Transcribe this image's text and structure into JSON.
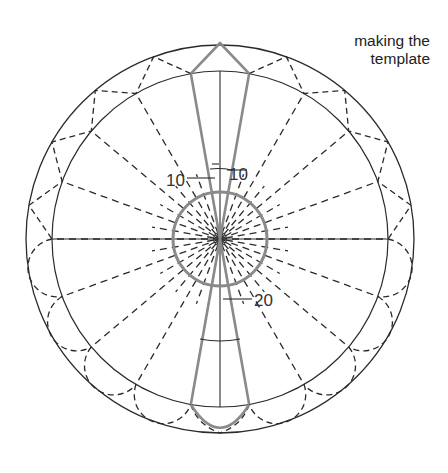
{
  "caption": {
    "line1": "making the",
    "line2": "template"
  },
  "geometry": {
    "center": [
      220,
      239
    ],
    "outer_radius": 194,
    "inner_radius": 168,
    "hub_radius": 47,
    "step_deg": 20
  },
  "labels": {
    "left_angle": "10",
    "right_angle": "10",
    "bottom_angle": "20"
  },
  "colors": {
    "line": "#2b2b2b",
    "gray": "#8a8a8a",
    "text": "#222222"
  }
}
